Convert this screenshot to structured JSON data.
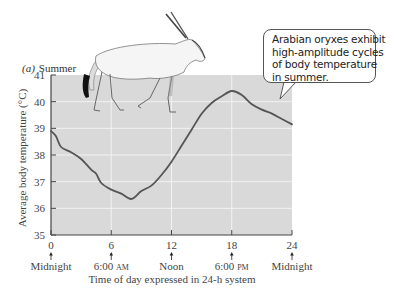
{
  "chart_data": {
    "type": "line",
    "title": "Summer",
    "panel_label": "(a)",
    "xlabel": "Time of day expressed in 24-h system",
    "ylabel": "Average body temperature (°C)",
    "xlim": [
      0,
      24
    ],
    "ylim": [
      35,
      41
    ],
    "grid": true,
    "x_ticks": [
      0,
      6,
      12,
      18,
      24
    ],
    "x_tick_sublabels": [
      "Midnight",
      "6:00 AM",
      "Noon",
      "6:00 PM",
      "Midnight"
    ],
    "y_ticks": [
      35,
      36,
      37,
      38,
      39,
      40,
      41
    ],
    "series": [
      {
        "name": "Arabian oryx body temperature (summer)",
        "x": [
          0,
          0.5,
          1,
          2,
          3,
          4,
          4.5,
          5,
          6,
          7,
          8,
          9,
          10,
          11,
          12,
          13,
          14,
          15,
          16,
          17,
          18,
          19,
          20,
          21,
          22,
          23,
          24
        ],
        "y": [
          38.9,
          38.7,
          38.3,
          38.1,
          37.85,
          37.45,
          37.3,
          36.95,
          36.7,
          36.55,
          36.35,
          36.65,
          36.85,
          37.25,
          37.75,
          38.35,
          38.95,
          39.55,
          39.95,
          40.2,
          40.4,
          40.25,
          39.9,
          39.7,
          39.55,
          39.35,
          39.15
        ]
      }
    ],
    "annotations": [
      "Arabian oryxes exhibit high-amplitude cycles of body temperature in summer."
    ],
    "colors": {
      "plot_bg": "#d9d9d9",
      "grid": "#f2f2f2",
      "line": "#555555",
      "axis": "#444444"
    }
  },
  "callout": {
    "lines": [
      "Arabian oryxes exhibit",
      "high-amplitude cycles",
      "of body temperature",
      "in summer."
    ]
  },
  "illustration": {
    "subject": "Arabian oryx"
  }
}
